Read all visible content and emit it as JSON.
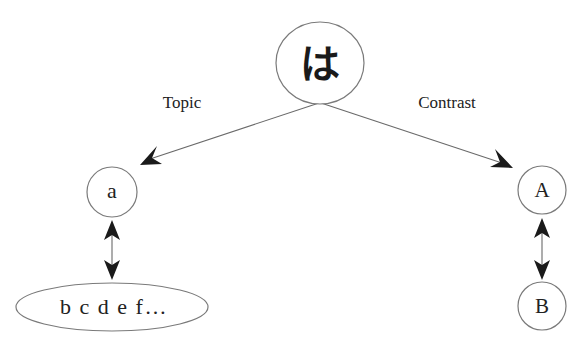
{
  "diagram": {
    "root": {
      "label": "は",
      "shape": "circle"
    },
    "edges": {
      "left_label": "Topic",
      "right_label": "Contrast"
    },
    "left_branch": {
      "node": {
        "label": "a",
        "shape": "circle"
      },
      "set": {
        "label": "b c d e f…",
        "shape": "ellipse"
      },
      "relation": "bidirectional-arrow"
    },
    "right_branch": {
      "node": {
        "label": "A",
        "shape": "circle"
      },
      "contrast_node": {
        "label": "B",
        "shape": "circle"
      },
      "relation": "bidirectional-arrow"
    }
  }
}
